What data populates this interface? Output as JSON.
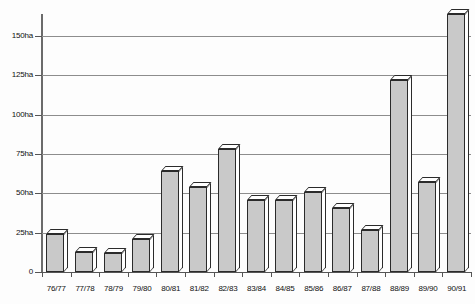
{
  "chart_data": {
    "type": "bar",
    "title": "",
    "xlabel": "",
    "ylabel": "",
    "unit": "ha",
    "ylim": [
      0,
      162
    ],
    "yticks": [
      0,
      25,
      50,
      75,
      100,
      125,
      150
    ],
    "ytick_labels": [
      "0",
      "25ha",
      "50ha",
      "75ha",
      "100ha",
      "125ha",
      "150ha"
    ],
    "grid": true,
    "legend": "none",
    "categories": [
      "76/77",
      "77/78",
      "78/79",
      "79/80",
      "80/81",
      "81/82",
      "82/83",
      "83/84",
      "84/85",
      "85/86",
      "86/87",
      "87/88",
      "88/89",
      "89/90",
      "90/91"
    ],
    "values": [
      24,
      13,
      12,
      21,
      64,
      54,
      78,
      46,
      46,
      51,
      41,
      27,
      122,
      57,
      164
    ],
    "bar_fill_color": "#c9c9c9",
    "bar_edge_color": "#2b2b2b",
    "bar_top_color": "#ffffff",
    "gridline_color": "#8d8d8d",
    "axis_color": "#555555",
    "background_color": "#fdfdfd"
  }
}
